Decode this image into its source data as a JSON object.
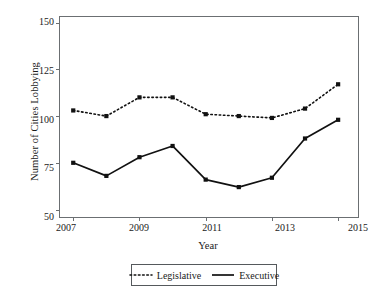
{
  "chart_data": {
    "type": "line",
    "title": "",
    "xlabel": "Year",
    "ylabel": "Number of Cities Lobbying",
    "x": [
      2007,
      2008,
      2009,
      2010,
      2011,
      2012,
      2013,
      2014,
      2015
    ],
    "xtick_labels": [
      "2007",
      "2009",
      "2011",
      "2013",
      "2015"
    ],
    "xticks": [
      2007,
      2009,
      2011,
      2013,
      2015
    ],
    "ytick_labels": [
      "50",
      "75",
      "100",
      "125",
      "150"
    ],
    "yticks": [
      50,
      75,
      100,
      125,
      150
    ],
    "xlim": [
      2006.6,
      2015.6
    ],
    "ylim": [
      46,
      153
    ],
    "grid": false,
    "legend_position": "bottom-center",
    "series": [
      {
        "name": "Legislative",
        "style": "dotted",
        "marker": "square",
        "color": "#111111",
        "values": [
          103,
          100,
          110,
          110,
          101,
          100,
          99,
          104,
          117
        ]
      },
      {
        "name": "Executive",
        "style": "solid",
        "marker": "square",
        "color": "#111111",
        "values": [
          75,
          68,
          78,
          84,
          66,
          62,
          67,
          88,
          98
        ]
      }
    ]
  },
  "legend": {
    "items": [
      {
        "label": "Legislative"
      },
      {
        "label": "Executive"
      }
    ]
  },
  "axes": {
    "frame_color": "#6b6f72"
  }
}
